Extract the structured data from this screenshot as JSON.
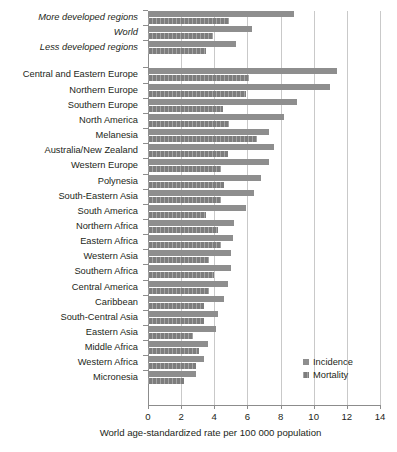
{
  "chart_data": {
    "type": "bar",
    "orientation": "horizontal",
    "title": "",
    "subtitle": "",
    "xlabel": "World age-standardized rate per 100 000 population",
    "ylabel": "",
    "xlim": [
      0,
      14
    ],
    "xticks": [
      0,
      2,
      4,
      6,
      8,
      10,
      12,
      14
    ],
    "xtick_labels": [
      "0",
      "2",
      "4",
      "6",
      "8",
      "10",
      "12",
      "14"
    ],
    "grid": "vertical",
    "legend_position": "inside-lower-right",
    "categories": [
      "More developed regions",
      "World",
      "Less developed regions",
      "Central and Eastern Europe",
      "Northern Europe",
      "Southern Europe",
      "North America",
      "Melanesia",
      "Australia/New Zealand",
      "Western Europe",
      "Polynesia",
      "South-Eastern Asia",
      "South America",
      "Northern Africa",
      "Eastern Africa",
      "Western Asia",
      "Southern Africa",
      "Central America",
      "Caribbean",
      "South-Central Asia",
      "Eastern Asia",
      "Middle Africa",
      "Western Africa",
      "Micronesia"
    ],
    "category_groups": [
      {
        "name": "aggregate",
        "italic": true,
        "indices": [
          0,
          1,
          2
        ]
      },
      {
        "name": "regions",
        "italic": false,
        "indices": [
          3,
          4,
          5,
          6,
          7,
          8,
          9,
          10,
          11,
          12,
          13,
          14,
          15,
          16,
          17,
          18,
          19,
          20,
          21,
          22,
          23
        ]
      }
    ],
    "series": [
      {
        "name": "Incidence",
        "color": "#8e8e8e",
        "values": [
          8.8,
          6.3,
          5.3,
          11.4,
          11.0,
          9.0,
          8.2,
          7.3,
          7.6,
          7.3,
          6.8,
          6.4,
          5.9,
          5.2,
          5.1,
          5.0,
          5.0,
          4.8,
          4.6,
          4.2,
          4.1,
          3.6,
          3.4,
          2.9
        ]
      },
      {
        "name": "Mortality",
        "color": "#7d7d7d",
        "values": [
          4.9,
          3.9,
          3.5,
          6.1,
          5.9,
          4.5,
          4.9,
          6.6,
          4.8,
          4.4,
          4.6,
          4.4,
          3.5,
          4.2,
          4.4,
          3.7,
          4.0,
          3.7,
          3.4,
          3.4,
          2.7,
          3.1,
          2.9,
          2.2
        ]
      }
    ]
  },
  "legend": {
    "items": [
      {
        "label": "Incidence",
        "swatch_class": "incidence"
      },
      {
        "label": "Mortality",
        "swatch_class": "mortality"
      }
    ]
  },
  "axis": {
    "x_title": "World age-standardized rate per 100 000 population"
  }
}
